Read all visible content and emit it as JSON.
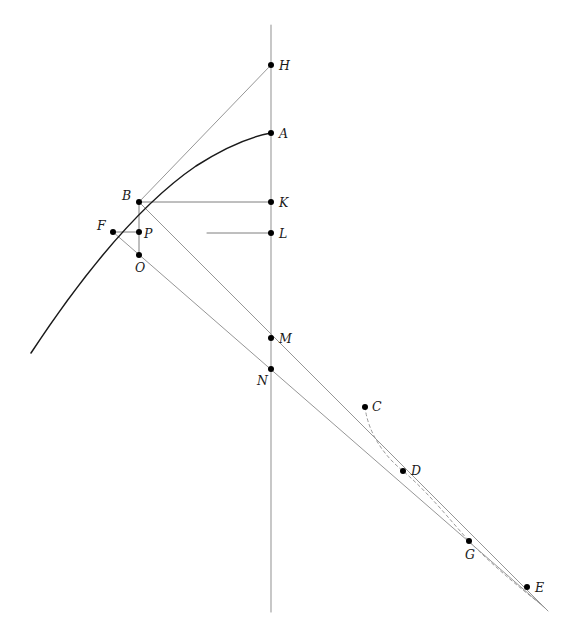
{
  "figure": {
    "kind": "geometric-construction-diagram",
    "background_color": "#ffffff",
    "width": 571,
    "height": 639,
    "curve_color": "#1a1a1a",
    "line_color": "#8a8a8a",
    "axis_color": "#9a9a9a",
    "dash_color": "#9a9a9a",
    "point_color": "#000000",
    "label_color": "#1a1a1a"
  },
  "points": [
    {
      "name": "H",
      "x": 271,
      "y": 65,
      "label": "H",
      "label_dx": 8,
      "label_dy": -5
    },
    {
      "name": "A",
      "x": 271,
      "y": 133,
      "label": "A",
      "label_dx": 8,
      "label_dy": -5
    },
    {
      "name": "B",
      "x": 139,
      "y": 202,
      "label": "B",
      "label_dx": -17,
      "label_dy": -12
    },
    {
      "name": "K",
      "x": 271,
      "y": 202,
      "label": "K",
      "label_dx": 8,
      "label_dy": -5
    },
    {
      "name": "F",
      "x": 113,
      "y": 232,
      "label": "F",
      "label_dx": -16,
      "label_dy": -12
    },
    {
      "name": "P",
      "x": 139,
      "y": 232,
      "label": "P",
      "label_dx": 5,
      "label_dy": -4
    },
    {
      "name": "L",
      "x": 271,
      "y": 233,
      "label": "L",
      "label_dx": 8,
      "label_dy": -5
    },
    {
      "name": "O",
      "x": 139,
      "y": 255,
      "label": "O",
      "label_dx": -4,
      "label_dy": 7
    },
    {
      "name": "M",
      "x": 271,
      "y": 338,
      "label": "M",
      "label_dx": 8,
      "label_dy": -5
    },
    {
      "name": "N",
      "x": 271,
      "y": 369,
      "label": "N",
      "label_dx": -14,
      "label_dy": 6
    },
    {
      "name": "C",
      "x": 365,
      "y": 407,
      "label": "C",
      "label_dx": 7,
      "label_dy": -6
    },
    {
      "name": "D",
      "x": 403,
      "y": 471,
      "label": "D",
      "label_dx": 8,
      "label_dy": -6
    },
    {
      "name": "G",
      "x": 469,
      "y": 541,
      "label": "G",
      "label_dx": -4,
      "label_dy": 8
    },
    {
      "name": "E",
      "x": 527,
      "y": 587,
      "label": "E",
      "label_dx": 8,
      "label_dy": -5
    }
  ],
  "curves": {
    "parabola": {
      "name": "main-parabola",
      "path": "M 31 353 Q 120 218 196 166 Q 238 139 271 133",
      "stroke": "#1a1a1a",
      "width": 1.5
    },
    "dashed_arc": {
      "name": "dashed-arc-c-to-g",
      "path": "M 365 407 C 368 432 383 455 403 471 C 428 492 450 520 469 541 C 492 565 520 588 543 606",
      "stroke": "#9a9a9a",
      "width": 1.0,
      "dash": "3,3"
    }
  },
  "segments": [
    {
      "name": "vertical-axis",
      "x1": 271,
      "y1": 25,
      "x2": 271,
      "y2": 612,
      "stroke": "#9a9a9a",
      "width": 1.1
    },
    {
      "name": "tangent-b-to-h",
      "x1": 139,
      "y1": 202,
      "x2": 271,
      "y2": 65,
      "stroke": "#8a8a8a",
      "width": 0.9
    },
    {
      "name": "segment-b-to-k",
      "x1": 139,
      "y1": 202,
      "x2": 271,
      "y2": 202,
      "stroke": "#6f6f6f",
      "width": 0.9
    },
    {
      "name": "segment-left-to-l",
      "x1": 207,
      "y1": 233,
      "x2": 271,
      "y2": 233,
      "stroke": "#6f6f6f",
      "width": 0.9
    },
    {
      "name": "segment-f-to-p",
      "x1": 113,
      "y1": 232,
      "x2": 139,
      "y2": 232,
      "stroke": "#6f6f6f",
      "width": 0.9
    },
    {
      "name": "segment-b-to-o",
      "x1": 139,
      "y1": 202,
      "x2": 139,
      "y2": 255,
      "stroke": "#6f6f6f",
      "width": 0.9
    },
    {
      "name": "ray-b-through-m",
      "x1": 139,
      "y1": 202,
      "x2": 548,
      "y2": 611,
      "stroke": "#8a8a8a",
      "width": 0.9
    },
    {
      "name": "ray-f-through-o-n",
      "x1": 113,
      "y1": 232,
      "x2": 545,
      "y2": 608,
      "stroke": "#8a8a8a",
      "width": 0.9
    }
  ]
}
